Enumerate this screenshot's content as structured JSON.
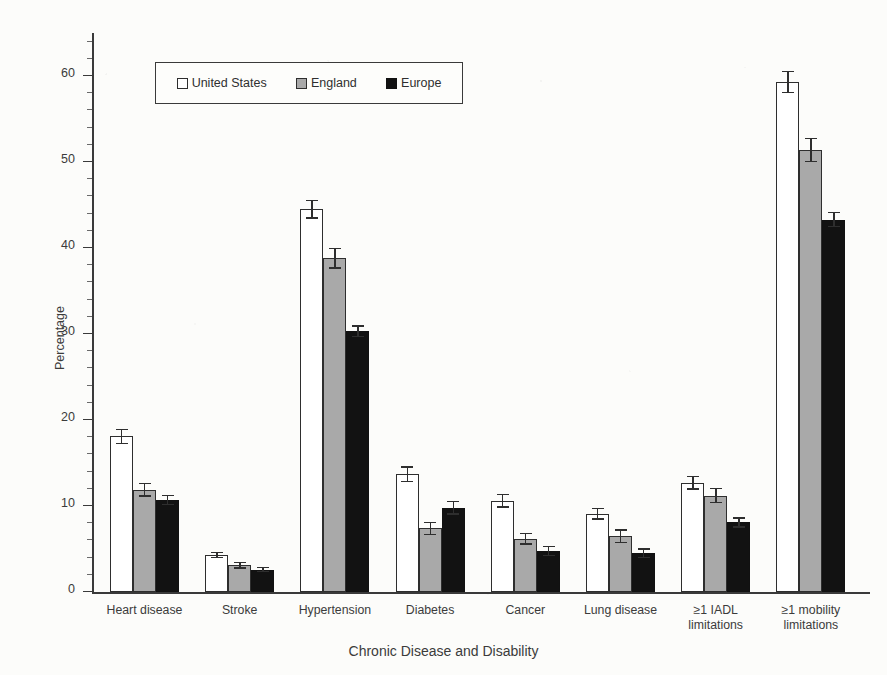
{
  "chart_data": {
    "type": "bar",
    "title": "",
    "xlabel": "Chronic Disease and Disability",
    "ylabel": "Percentage",
    "ylim": [
      0,
      65
    ],
    "yticks": [
      0,
      10,
      20,
      30,
      40,
      50,
      60
    ],
    "ytick_labels": [
      "0",
      "10",
      "20",
      "30",
      "40",
      "50",
      "60"
    ],
    "grid": false,
    "legend_position": "upper left",
    "error_bars": "95% confidence interval",
    "categories": [
      "Heart disease",
      "Stroke",
      "Hypertension",
      "Diabetes",
      "Cancer",
      "Lung disease",
      "≥1 IADL limitations",
      "≥1 mobility limitations"
    ],
    "category_lines": [
      [
        "Heart disease"
      ],
      [
        "Stroke"
      ],
      [
        "Hypertension"
      ],
      [
        "Diabetes"
      ],
      [
        "Cancer"
      ],
      [
        "Lung disease"
      ],
      [
        "≥1 IADL",
        "limitations"
      ],
      [
        "≥1 mobility",
        "limitations"
      ]
    ],
    "series": [
      {
        "name": "United States",
        "color": "#ffffff",
        "values": [
          18.1,
          4.3,
          44.5,
          13.7,
          10.6,
          9.1,
          12.7,
          59.3
        ],
        "errors": [
          0.9,
          0.4,
          1.1,
          0.9,
          0.8,
          0.7,
          0.8,
          1.3
        ]
      },
      {
        "name": "England",
        "color": "#a9a9a9",
        "values": [
          11.9,
          3.1,
          38.8,
          7.4,
          6.2,
          6.5,
          11.2,
          51.4
        ],
        "errors": [
          0.8,
          0.4,
          1.2,
          0.8,
          0.7,
          0.8,
          0.9,
          1.4
        ]
      },
      {
        "name": "Europe",
        "color": "#121212",
        "values": [
          10.7,
          2.6,
          30.3,
          9.8,
          4.8,
          4.5,
          8.1,
          43.3
        ],
        "errors": [
          0.6,
          0.3,
          0.7,
          0.8,
          0.6,
          0.6,
          0.6,
          0.9
        ]
      }
    ]
  },
  "legend": {
    "items": [
      {
        "label": "United States",
        "swatch": "us"
      },
      {
        "label": "England",
        "swatch": "eng"
      },
      {
        "label": "Europe",
        "swatch": "eur"
      }
    ]
  },
  "axes": {
    "y_title": "Percentage",
    "x_title": "Chronic Disease and Disability"
  }
}
